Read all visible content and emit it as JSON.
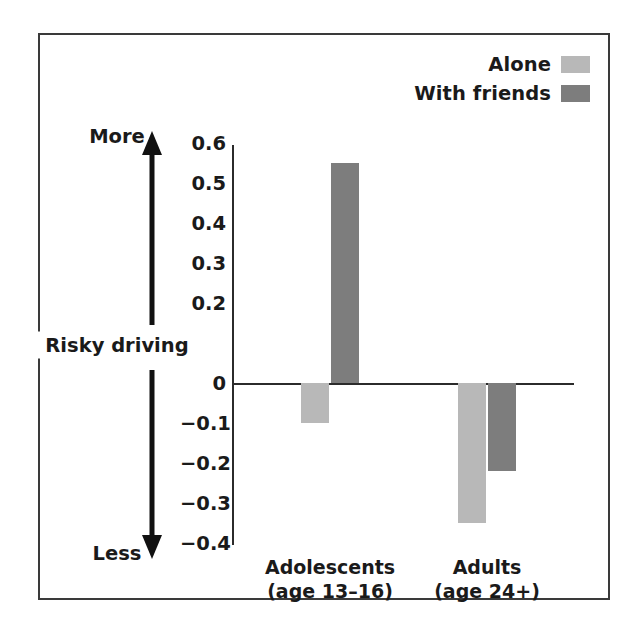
{
  "legend": {
    "items": [
      {
        "label": "Alone",
        "color": "#b8b8b8"
      },
      {
        "label": "With friends",
        "color": "#7d7d7d"
      }
    ]
  },
  "axis_annotation": {
    "top_label": "More",
    "bottom_label": "Less",
    "center_label": "Risky driving",
    "arrow_icon": "double-headed-vertical-arrow-icon"
  },
  "chart_data": {
    "type": "bar",
    "title": "",
    "xlabel": "",
    "ylabel": "Risky driving",
    "ylim": [
      -0.4,
      0.6
    ],
    "grid": false,
    "legend_position": "top-right",
    "categories": [
      "Adolescents\n(age 13–16)",
      "Adults\n(age 24+)"
    ],
    "category_lines": [
      [
        "Adolescents",
        "(age 13–16)"
      ],
      [
        "Adults",
        "(age 24+)"
      ]
    ],
    "series": [
      {
        "name": "Alone",
        "color": "#b8b8b8",
        "values": [
          -0.1,
          -0.35
        ]
      },
      {
        "name": "With friends",
        "color": "#7d7d7d",
        "values": [
          0.55,
          -0.22
        ]
      }
    ],
    "yticks": [
      0.6,
      0.5,
      0.4,
      0.3,
      0.2,
      0.1,
      0,
      -0.1,
      -0.2,
      -0.3,
      -0.4
    ],
    "ytick_labels": [
      "0.6",
      "0.5",
      "0.4",
      "0.3",
      "0.2",
      "0.1",
      "0",
      "−0.1",
      "−0.2",
      "−0.3",
      "−0.4"
    ]
  }
}
